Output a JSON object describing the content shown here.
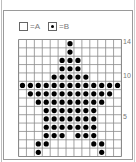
{
  "legend": [
    {
      "symbol": "empty",
      "label": "=A"
    },
    {
      "symbol": "dot",
      "label": "=B"
    }
  ],
  "grid": {
    "columns": 13,
    "rows": 14,
    "row_labels": [
      {
        "row": 14,
        "text": "14"
      },
      {
        "row": 10,
        "text": "10"
      },
      {
        "row": 5,
        "text": "5"
      }
    ],
    "filled": {
      "14": [
        7
      ],
      "13": [
        7
      ],
      "12": [
        6,
        7,
        8
      ],
      "11": [
        6,
        7,
        8
      ],
      "10": [
        5,
        6,
        7,
        8,
        9
      ],
      "9": [
        1,
        2,
        3,
        4,
        5,
        6,
        7,
        8,
        9,
        10,
        11,
        12,
        13
      ],
      "8": [
        2,
        3,
        4,
        5,
        6,
        7,
        8,
        9,
        10,
        11,
        12
      ],
      "7": [
        3,
        4,
        5,
        6,
        7,
        8,
        9,
        10,
        11
      ],
      "6": [
        4,
        5,
        6,
        7,
        8,
        9,
        10
      ],
      "5": [
        4,
        5,
        6,
        7,
        8,
        9,
        10
      ],
      "4": [
        4,
        5,
        6,
        7,
        8,
        9,
        10
      ],
      "3": [
        4,
        5,
        6,
        8,
        9,
        10
      ],
      "2": [
        3,
        4,
        10,
        11
      ],
      "1": [
        3,
        11
      ]
    }
  },
  "colors": {
    "grid_line": "#8a8a8a",
    "dot": "#000000",
    "label": "#777777"
  }
}
